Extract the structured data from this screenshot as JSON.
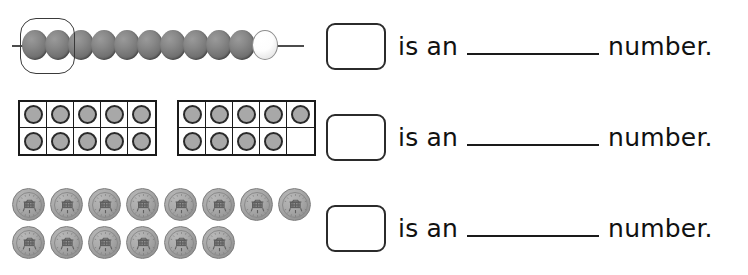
{
  "worksheet": {
    "rows": [
      {
        "id": "bead-string-row",
        "manipulative": "bead-string",
        "gray_bead_count": 10,
        "white_bead_count": 1,
        "total_beads": 11,
        "circled_bead_count": 2,
        "prompt": {
          "answer_value": "",
          "text_before_blank": "is an",
          "text_after_blank": "number."
        }
      },
      {
        "id": "ten-frame-row",
        "manipulative": "ten-frames",
        "frames": [
          {
            "filled": 10,
            "cells": [
              true,
              true,
              true,
              true,
              true,
              true,
              true,
              true,
              true,
              true
            ]
          },
          {
            "filled": 9,
            "cells": [
              true,
              true,
              true,
              true,
              true,
              true,
              true,
              true,
              true,
              false
            ]
          }
        ],
        "total_counters": 19,
        "prompt": {
          "answer_value": "",
          "text_before_blank": "is an",
          "text_after_blank": "number."
        }
      },
      {
        "id": "coins-row",
        "manipulative": "coins",
        "coin_rows": [
          8,
          6
        ],
        "total_coins": 14,
        "prompt": {
          "answer_value": "",
          "text_before_blank": "is an",
          "text_after_blank": "number."
        }
      }
    ]
  },
  "colors": {
    "bead_gray": "#7d7d7d",
    "bead_white": "#ffffff",
    "counter_fill": "#a8a8a8",
    "counter_ring": "#2a2a2a",
    "coin_gray": "#a3a3a3",
    "ink": "#1a1a1a",
    "page_background": "#ffffff"
  }
}
